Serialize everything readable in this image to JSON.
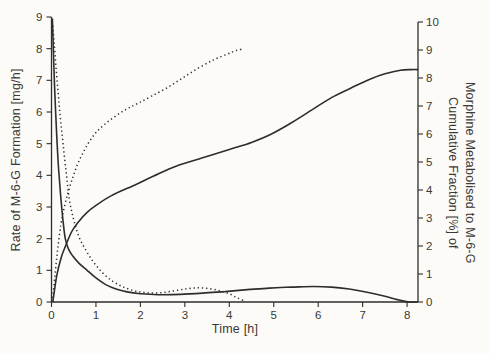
{
  "figure": {
    "background": "#fcfbf8",
    "ink": "#2e2d2a"
  },
  "chart_data": {
    "type": "line",
    "title": "",
    "xlabel": "Time [h]",
    "x_range": [
      0,
      8.25
    ],
    "x_ticks": [
      0,
      1,
      2,
      3,
      4,
      5,
      6,
      7,
      8
    ],
    "grid": false,
    "legend": "none",
    "left_axis": {
      "label": "Rate of M-6-G Formation [mg/h]",
      "range": [
        0,
        9
      ],
      "ticks": [
        0,
        1,
        2,
        3,
        4,
        5,
        6,
        7,
        8,
        9
      ]
    },
    "right_axis": {
      "label_line1": "Cumulative Fraction [%] of",
      "label_line2": "Morphine Metabolised to M-6-G",
      "range": [
        0,
        10
      ],
      "ticks": [
        0,
        1,
        2,
        3,
        4,
        5,
        6,
        7,
        8,
        9,
        10
      ]
    },
    "series": [
      {
        "name": "rate-dotted",
        "axis": "left",
        "line_style": "dotted",
        "points": [
          [
            0.03,
            8.72
          ],
          [
            0.06,
            8.2
          ],
          [
            0.1,
            7.45
          ],
          [
            0.15,
            6.6
          ],
          [
            0.2,
            5.8
          ],
          [
            0.26,
            5.0
          ],
          [
            0.33,
            4.1
          ],
          [
            0.4,
            3.25
          ],
          [
            0.5,
            2.6
          ],
          [
            0.62,
            2.05
          ],
          [
            0.78,
            1.62
          ],
          [
            0.95,
            1.25
          ],
          [
            1.15,
            0.92
          ],
          [
            1.38,
            0.65
          ],
          [
            1.62,
            0.47
          ],
          [
            1.88,
            0.35
          ],
          [
            2.15,
            0.29
          ],
          [
            2.45,
            0.29
          ],
          [
            2.75,
            0.35
          ],
          [
            3.05,
            0.42
          ],
          [
            3.3,
            0.45
          ],
          [
            3.55,
            0.42
          ],
          [
            3.8,
            0.35
          ],
          [
            4.0,
            0.26
          ],
          [
            4.18,
            0.13
          ],
          [
            4.35,
            0.03
          ]
        ]
      },
      {
        "name": "rate-solid",
        "axis": "left",
        "line_style": "solid",
        "points": [
          [
            0.02,
            8.95
          ],
          [
            0.05,
            7.6
          ],
          [
            0.08,
            6.4
          ],
          [
            0.12,
            5.2
          ],
          [
            0.16,
            4.2
          ],
          [
            0.21,
            3.3
          ],
          [
            0.26,
            2.55
          ],
          [
            0.31,
            2.0
          ],
          [
            0.38,
            1.68
          ],
          [
            0.48,
            1.45
          ],
          [
            0.62,
            1.22
          ],
          [
            0.8,
            1.0
          ],
          [
            1.0,
            0.76
          ],
          [
            1.22,
            0.55
          ],
          [
            1.45,
            0.41
          ],
          [
            1.7,
            0.32
          ],
          [
            2.0,
            0.26
          ],
          [
            2.4,
            0.23
          ],
          [
            2.9,
            0.24
          ],
          [
            3.4,
            0.28
          ],
          [
            3.9,
            0.33
          ],
          [
            4.4,
            0.39
          ],
          [
            4.9,
            0.44
          ],
          [
            5.4,
            0.47
          ],
          [
            5.9,
            0.49
          ],
          [
            6.3,
            0.47
          ],
          [
            6.7,
            0.41
          ],
          [
            7.1,
            0.31
          ],
          [
            7.5,
            0.18
          ],
          [
            7.85,
            0.05
          ],
          [
            8.05,
            0.0
          ],
          [
            8.24,
            0.0
          ]
        ]
      },
      {
        "name": "cumulative-dotted",
        "axis": "right",
        "line_style": "dotted",
        "points": [
          [
            0.02,
            0.0
          ],
          [
            0.08,
            1.0
          ],
          [
            0.14,
            1.9
          ],
          [
            0.21,
            2.75
          ],
          [
            0.29,
            3.4
          ],
          [
            0.38,
            3.95
          ],
          [
            0.48,
            4.45
          ],
          [
            0.58,
            4.9
          ],
          [
            0.7,
            5.3
          ],
          [
            0.84,
            5.7
          ],
          [
            1.0,
            6.05
          ],
          [
            1.2,
            6.35
          ],
          [
            1.45,
            6.65
          ],
          [
            1.7,
            6.9
          ],
          [
            1.95,
            7.1
          ],
          [
            2.25,
            7.35
          ],
          [
            2.6,
            7.65
          ],
          [
            2.95,
            8.0
          ],
          [
            3.3,
            8.35
          ],
          [
            3.65,
            8.65
          ],
          [
            3.95,
            8.85
          ],
          [
            4.15,
            8.98
          ],
          [
            4.33,
            9.05
          ]
        ]
      },
      {
        "name": "cumulative-solid",
        "axis": "right",
        "line_style": "solid",
        "points": [
          [
            0.03,
            0.0
          ],
          [
            0.12,
            0.95
          ],
          [
            0.22,
            1.6
          ],
          [
            0.31,
            1.98
          ],
          [
            0.45,
            2.5
          ],
          [
            0.6,
            2.85
          ],
          [
            0.8,
            3.2
          ],
          [
            1.0,
            3.45
          ],
          [
            1.35,
            3.8
          ],
          [
            1.9,
            4.2
          ],
          [
            2.3,
            4.5
          ],
          [
            2.8,
            4.85
          ],
          [
            3.4,
            5.15
          ],
          [
            4.0,
            5.45
          ],
          [
            4.5,
            5.7
          ],
          [
            4.95,
            6.0
          ],
          [
            5.4,
            6.4
          ],
          [
            5.85,
            6.85
          ],
          [
            6.3,
            7.3
          ],
          [
            6.75,
            7.65
          ],
          [
            7.15,
            7.95
          ],
          [
            7.5,
            8.15
          ],
          [
            7.85,
            8.28
          ],
          [
            8.1,
            8.3
          ],
          [
            8.25,
            8.3
          ]
        ]
      }
    ]
  }
}
